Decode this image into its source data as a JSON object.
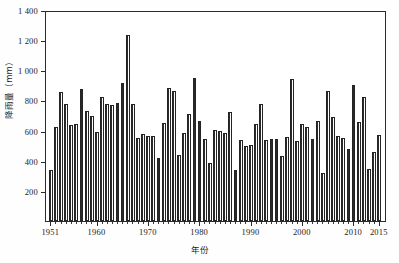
{
  "chart_data": {
    "type": "bar",
    "title": "",
    "subtitle": "",
    "xlabel": "年份",
    "ylabel": "降雨量（mm）",
    "ylim": [
      0,
      1400
    ],
    "xlim": [
      1951,
      2015
    ],
    "grid": false,
    "legend": null,
    "y_ticks": [
      "1 400",
      "1 200",
      "1 000",
      "800",
      "600",
      "400",
      "200"
    ],
    "y_tick_values": [
      1400,
      1200,
      1000,
      800,
      600,
      400,
      200
    ],
    "x_ticks": [
      "1951",
      "1960",
      "1970",
      "1980",
      "1990",
      "2000",
      "2010",
      "2015"
    ],
    "x_tick_values": [
      1951,
      1960,
      1970,
      1980,
      1990,
      2000,
      2010,
      2015
    ],
    "categories": [
      1951,
      1952,
      1953,
      1954,
      1955,
      1956,
      1957,
      1958,
      1959,
      1960,
      1961,
      1962,
      1963,
      1964,
      1965,
      1966,
      1967,
      1968,
      1969,
      1970,
      1971,
      1972,
      1973,
      1974,
      1975,
      1976,
      1977,
      1978,
      1979,
      1980,
      1981,
      1982,
      1983,
      1984,
      1985,
      1986,
      1987,
      1988,
      1989,
      1990,
      1991,
      1992,
      1993,
      1994,
      1995,
      1996,
      1997,
      1998,
      1999,
      2000,
      2001,
      2002,
      2003,
      2004,
      2005,
      2006,
      2007,
      2008,
      2009,
      2010,
      2011,
      2012,
      2013,
      2014,
      2015
    ],
    "values": [
      340,
      630,
      860,
      780,
      640,
      645,
      880,
      735,
      700,
      595,
      825,
      780,
      775,
      790,
      920,
      1240,
      780,
      555,
      580,
      570,
      570,
      420,
      655,
      890,
      865,
      440,
      590,
      715,
      955,
      670,
      545,
      385,
      605,
      600,
      590,
      725,
      340,
      540,
      500,
      510,
      650,
      780,
      540,
      545,
      545,
      435,
      560,
      945,
      535,
      650,
      625,
      545,
      665,
      320,
      865,
      695,
      565,
      555,
      480,
      910,
      660,
      825,
      350,
      460,
      575
    ],
    "peak": {
      "year": 1966,
      "value": 1240
    },
    "series_name": "年降雨量"
  },
  "axis": {
    "y_title": "降雨量（mm）",
    "x_title": "年份"
  }
}
